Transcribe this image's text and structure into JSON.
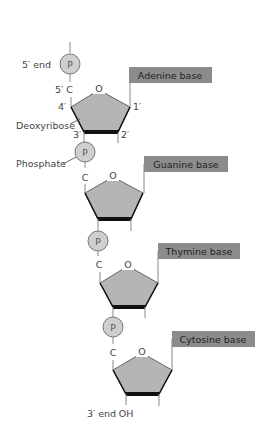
{
  "diagram": {
    "type": "dna-strand",
    "colors": {
      "sugar_fill": "#b5b5b5",
      "sugar_stroke": "#666666",
      "bond_bottom": "#111111",
      "phosphate_fill": "#cfcfcf",
      "base_box": "#8c8c8c",
      "line": "#888888"
    },
    "labels": {
      "five_prime_end": "5′ end",
      "five_prime_c": "5′ C",
      "four_prime": "4′",
      "one_prime": "1′",
      "two_prime": "2′",
      "three_prime": "3′",
      "deoxyribose": "Deoxyribose",
      "phosphate": "Phosphate",
      "three_prime_end": "3′ end",
      "oh": "OH",
      "oxygen": "O",
      "carbon": "C",
      "phosphate_symbol": "P"
    },
    "nucleotides": [
      {
        "base": "Adenine base"
      },
      {
        "base": "Guanine base"
      },
      {
        "base": "Thymine base"
      },
      {
        "base": "Cytosine base"
      }
    ]
  }
}
